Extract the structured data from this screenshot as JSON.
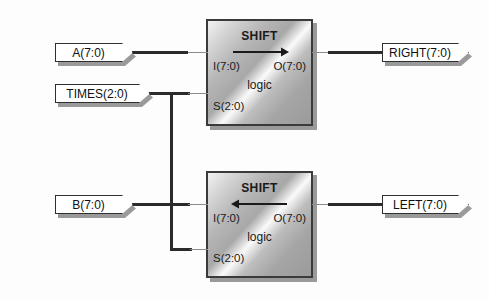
{
  "diagram": {
    "background_color": "#fdfdfd",
    "wire_color": "#2b2b2b",
    "block_border_color": "#3a3a3a"
  },
  "ports": {
    "inputs": [
      {
        "name": "a-input-port",
        "label": "A(7:0)"
      },
      {
        "name": "times-input-port",
        "label": "TIMES(2:0)"
      },
      {
        "name": "b-input-port",
        "label": "B(7:0)"
      }
    ],
    "outputs": [
      {
        "name": "right-output-port",
        "label": "RIGHT(7:0)"
      },
      {
        "name": "left-output-port",
        "label": "LEFT(7:0)"
      }
    ]
  },
  "blocks": [
    {
      "id": "shift-right-block",
      "title": "SHIFT",
      "subtitle": "logic",
      "direction": "right",
      "pin_in": "I(7:0)",
      "pin_out": "O(7:0)",
      "pin_sel": "S(2:0)"
    },
    {
      "id": "shift-left-block",
      "title": "SHIFT",
      "subtitle": "logic",
      "direction": "left",
      "pin_in": "I(7:0)",
      "pin_out": "O(7:0)",
      "pin_sel": "S(2:0)"
    }
  ]
}
